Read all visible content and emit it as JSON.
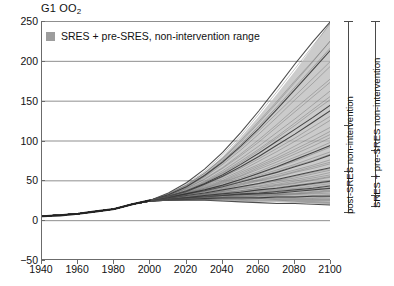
{
  "chart_data": {
    "type": "line",
    "title": "G1 OO2",
    "title_main": "G1 OO",
    "title_sub": "2",
    "xlabel": "",
    "ylabel": "",
    "xlim": [
      1940,
      2100
    ],
    "ylim": [
      -50,
      250
    ],
    "x_ticks": [
      1940,
      1960,
      1980,
      2000,
      2020,
      2040,
      2060,
      2080,
      2100
    ],
    "y_ticks": [
      -50,
      0,
      50,
      100,
      150,
      200,
      250
    ],
    "grid": "horizontal",
    "legend_position": "top-left-inside",
    "legend": [
      {
        "label": "SRES + pre-SRES, non-intervention range",
        "color": "#9d9d9d",
        "marker": "filled-square"
      }
    ],
    "band": {
      "name": "SRES + pre-SRES, non-intervention range",
      "color": "#9d9d9d",
      "x": [
        1940,
        1960,
        1980,
        1990,
        2000,
        2010,
        2020,
        2030,
        2040,
        2050,
        2060,
        2070,
        2080,
        2090,
        2100
      ],
      "upper": [
        5,
        8,
        14,
        20,
        25,
        33,
        44,
        60,
        80,
        104,
        130,
        158,
        187,
        218,
        250
      ],
      "lower": [
        5,
        8,
        14,
        20,
        24,
        27,
        29,
        30,
        30,
        29,
        27,
        25,
        23,
        21,
        19
      ]
    },
    "historical": {
      "name": "historical",
      "x": [
        1940,
        1950,
        1960,
        1970,
        1980,
        1990,
        2000
      ],
      "values": [
        5,
        6,
        8,
        11,
        14,
        20,
        25
      ]
    },
    "series": [
      {
        "name": "scenario-01",
        "values": [
          5,
          8,
          14,
          20,
          25,
          34,
          47,
          64,
          85,
          110,
          137,
          166,
          196,
          224,
          250
        ]
      },
      {
        "name": "scenario-02",
        "values": [
          5,
          8,
          14,
          20,
          25,
          33,
          44,
          59,
          78,
          100,
          124,
          149,
          175,
          200,
          226
        ]
      },
      {
        "name": "scenario-03",
        "values": [
          5,
          8,
          14,
          20,
          25,
          32,
          42,
          55,
          72,
          91,
          112,
          134,
          156,
          178,
          200
        ]
      },
      {
        "name": "scenario-04",
        "values": [
          5,
          8,
          14,
          20,
          25,
          31,
          40,
          52,
          66,
          83,
          101,
          120,
          140,
          159,
          178
        ]
      },
      {
        "name": "scenario-05",
        "values": [
          5,
          8,
          14,
          20,
          25,
          31,
          39,
          49,
          62,
          77,
          93,
          110,
          127,
          145,
          163
        ]
      },
      {
        "name": "scenario-06",
        "values": [
          5,
          8,
          14,
          20,
          25,
          30,
          37,
          46,
          57,
          70,
          84,
          99,
          114,
          129,
          145
        ]
      },
      {
        "name": "scenario-07",
        "values": [
          5,
          8,
          14,
          20,
          25,
          30,
          36,
          44,
          54,
          65,
          77,
          90,
          103,
          117,
          131
        ]
      },
      {
        "name": "scenario-08",
        "values": [
          5,
          8,
          14,
          20,
          25,
          30,
          35,
          42,
          50,
          60,
          70,
          81,
          93,
          105,
          117
        ]
      },
      {
        "name": "scenario-09",
        "values": [
          5,
          8,
          14,
          20,
          25,
          29,
          34,
          40,
          47,
          55,
          64,
          73,
          83,
          93,
          104
        ]
      },
      {
        "name": "scenario-10",
        "values": [
          5,
          8,
          14,
          20,
          25,
          29,
          33,
          38,
          44,
          51,
          58,
          66,
          74,
          83,
          92
        ]
      },
      {
        "name": "scenario-11",
        "values": [
          5,
          8,
          14,
          20,
          25,
          29,
          33,
          37,
          42,
          48,
          54,
          60,
          67,
          74,
          82
        ]
      },
      {
        "name": "scenario-12",
        "values": [
          5,
          8,
          14,
          20,
          25,
          28,
          32,
          36,
          40,
          45,
          50,
          55,
          61,
          67,
          73
        ]
      },
      {
        "name": "scenario-13",
        "values": [
          5,
          8,
          14,
          20,
          25,
          28,
          31,
          34,
          38,
          42,
          46,
          50,
          55,
          60,
          65
        ]
      },
      {
        "name": "scenario-14",
        "values": [
          5,
          8,
          14,
          20,
          24,
          27,
          30,
          33,
          36,
          39,
          42,
          45,
          49,
          53,
          57
        ]
      },
      {
        "name": "scenario-15",
        "values": [
          5,
          8,
          14,
          20,
          24,
          27,
          29,
          31,
          34,
          36,
          38,
          41,
          44,
          47,
          50
        ]
      },
      {
        "name": "scenario-16",
        "values": [
          5,
          8,
          14,
          20,
          24,
          26,
          28,
          30,
          31,
          33,
          34,
          36,
          38,
          40,
          43
        ]
      },
      {
        "name": "scenario-17",
        "values": [
          5,
          8,
          14,
          20,
          24,
          26,
          28,
          29,
          30,
          30,
          31,
          32,
          33,
          35,
          37
        ]
      },
      {
        "name": "scenario-18",
        "values": [
          5,
          8,
          14,
          20,
          24,
          26,
          27,
          28,
          28,
          28,
          28,
          29,
          29,
          30,
          31
        ]
      },
      {
        "name": "scenario-19",
        "values": [
          5,
          8,
          14,
          20,
          24,
          26,
          27,
          27,
          27,
          26,
          26,
          26,
          26,
          26,
          26
        ]
      },
      {
        "name": "scenario-20",
        "values": [
          5,
          8,
          14,
          20,
          24,
          25,
          26,
          26,
          25,
          25,
          24,
          24,
          23,
          23,
          22
        ]
      },
      {
        "name": "scenario-21",
        "values": [
          5,
          8,
          14,
          20,
          24,
          25,
          25,
          25,
          24,
          23,
          22,
          21,
          21,
          20,
          19
        ]
      },
      {
        "name": "scenario-22",
        "values": [
          5,
          8,
          14,
          20,
          25,
          31,
          41,
          54,
          70,
          88,
          108,
          129,
          151,
          172,
          194
        ]
      },
      {
        "name": "scenario-23",
        "values": [
          5,
          8,
          14,
          20,
          25,
          32,
          43,
          57,
          75,
          95,
          118,
          142,
          167,
          192,
          217
        ]
      },
      {
        "name": "scenario-24",
        "values": [
          5,
          8,
          14,
          20,
          25,
          33,
          45,
          61,
          82,
          106,
          133,
          161,
          190,
          219,
          248
        ]
      },
      {
        "name": "scenario-25",
        "values": [
          5,
          8,
          14,
          20,
          25,
          30,
          38,
          48,
          60,
          74,
          89,
          105,
          122,
          139,
          156
        ]
      },
      {
        "name": "scenario-26",
        "values": [
          5,
          8,
          14,
          20,
          25,
          30,
          36,
          45,
          55,
          67,
          80,
          94,
          108,
          123,
          138
        ]
      },
      {
        "name": "scenario-27",
        "values": [
          5,
          8,
          14,
          20,
          25,
          29,
          35,
          41,
          49,
          58,
          68,
          78,
          89,
          100,
          112
        ]
      },
      {
        "name": "scenario-28",
        "values": [
          5,
          8,
          14,
          20,
          25,
          29,
          34,
          39,
          46,
          53,
          61,
          70,
          79,
          88,
          98
        ]
      },
      {
        "name": "scenario-29",
        "values": [
          5,
          8,
          14,
          20,
          25,
          29,
          33,
          38,
          43,
          49,
          56,
          63,
          70,
          78,
          86
        ]
      },
      {
        "name": "scenario-30",
        "values": [
          5,
          8,
          14,
          20,
          24,
          28,
          32,
          36,
          41,
          46,
          51,
          57,
          63,
          69,
          76
        ]
      },
      {
        "name": "scenario-31",
        "values": [
          5,
          8,
          14,
          20,
          24,
          27,
          31,
          34,
          38,
          42,
          46,
          51,
          56,
          61,
          66
        ]
      },
      {
        "name": "scenario-32",
        "values": [
          5,
          8,
          14,
          20,
          24,
          27,
          30,
          33,
          36,
          40,
          43,
          47,
          51,
          55,
          60
        ]
      },
      {
        "name": "scenario-33",
        "values": [
          5,
          8,
          14,
          20,
          24,
          27,
          29,
          32,
          35,
          37,
          40,
          43,
          46,
          50,
          54
        ]
      },
      {
        "name": "scenario-34",
        "values": [
          5,
          8,
          14,
          20,
          24,
          26,
          29,
          31,
          33,
          35,
          37,
          39,
          42,
          45,
          48
        ]
      },
      {
        "name": "scenario-35",
        "values": [
          5,
          8,
          14,
          20,
          24,
          26,
          28,
          30,
          32,
          33,
          35,
          37,
          39,
          41,
          44
        ]
      },
      {
        "name": "scenario-36",
        "values": [
          5,
          8,
          14,
          20,
          24,
          26,
          28,
          29,
          31,
          32,
          33,
          34,
          36,
          38,
          40
        ]
      },
      {
        "name": "scenario-37",
        "values": [
          5,
          8,
          14,
          20,
          24,
          26,
          27,
          29,
          30,
          30,
          31,
          32,
          33,
          34,
          36
        ]
      },
      {
        "name": "scenario-38",
        "values": [
          5,
          8,
          14,
          20,
          24,
          26,
          27,
          28,
          29,
          29,
          29,
          30,
          30,
          31,
          32
        ]
      },
      {
        "name": "scenario-39",
        "values": [
          5,
          8,
          14,
          20,
          24,
          25,
          26,
          27,
          27,
          27,
          27,
          28,
          28,
          28,
          29
        ]
      },
      {
        "name": "scenario-40",
        "values": [
          5,
          8,
          14,
          20,
          24,
          25,
          26,
          26,
          26,
          26,
          25,
          25,
          25,
          25,
          25
        ]
      },
      {
        "name": "scenario-41",
        "values": [
          5,
          8,
          14,
          20,
          25,
          32,
          42,
          56,
          73,
          93,
          115,
          139,
          164,
          189,
          214
        ]
      },
      {
        "name": "scenario-42",
        "values": [
          5,
          8,
          14,
          20,
          25,
          31,
          40,
          51,
          65,
          81,
          98,
          117,
          136,
          155,
          174
        ]
      },
      {
        "name": "scenario-43",
        "values": [
          5,
          8,
          14,
          20,
          25,
          30,
          37,
          47,
          59,
          72,
          87,
          103,
          119,
          136,
          152
        ]
      },
      {
        "name": "scenario-44",
        "values": [
          5,
          8,
          14,
          20,
          25,
          30,
          36,
          43,
          52,
          62,
          74,
          86,
          99,
          112,
          126
        ]
      },
      {
        "name": "scenario-45",
        "values": [
          5,
          8,
          14,
          20,
          25,
          29,
          34,
          40,
          48,
          56,
          66,
          76,
          86,
          97,
          108
        ]
      },
      {
        "name": "scenario-46",
        "values": [
          5,
          8,
          14,
          20,
          24,
          28,
          33,
          38,
          44,
          51,
          59,
          67,
          76,
          85,
          94
        ]
      },
      {
        "name": "scenario-47",
        "values": [
          5,
          8,
          14,
          20,
          24,
          28,
          32,
          37,
          42,
          48,
          54,
          61,
          68,
          75,
          83
        ]
      },
      {
        "name": "scenario-48",
        "values": [
          5,
          8,
          14,
          20,
          24,
          27,
          31,
          35,
          39,
          44,
          49,
          54,
          60,
          65,
          71
        ]
      },
      {
        "name": "scenario-49",
        "values": [
          5,
          8,
          14,
          20,
          24,
          27,
          30,
          33,
          37,
          41,
          45,
          49,
          53,
          58,
          63
        ]
      },
      {
        "name": "scenario-50",
        "values": [
          5,
          8,
          14,
          20,
          24,
          26,
          29,
          32,
          34,
          37,
          40,
          44,
          47,
          51,
          55
        ]
      },
      {
        "name": "scenario-51",
        "values": [
          5,
          8,
          14,
          20,
          24,
          26,
          28,
          31,
          33,
          35,
          38,
          40,
          43,
          46,
          49
        ]
      },
      {
        "name": "scenario-52",
        "values": [
          5,
          8,
          14,
          20,
          24,
          26,
          28,
          30,
          32,
          34,
          36,
          38,
          40,
          43,
          46
        ]
      },
      {
        "name": "scenario-53",
        "values": [
          5,
          8,
          14,
          20,
          24,
          26,
          27,
          29,
          31,
          32,
          33,
          35,
          37,
          39,
          41
        ]
      },
      {
        "name": "scenario-54",
        "values": [
          5,
          8,
          14,
          20,
          24,
          25,
          27,
          28,
          29,
          31,
          32,
          33,
          34,
          36,
          38
        ]
      },
      {
        "name": "scenario-55",
        "values": [
          5,
          8,
          14,
          20,
          24,
          25,
          26,
          28,
          29,
          29,
          30,
          31,
          32,
          33,
          34
        ]
      },
      {
        "name": "scenario-56",
        "values": [
          5,
          8,
          14,
          20,
          24,
          25,
          26,
          27,
          28,
          28,
          28,
          29,
          29,
          30,
          30
        ]
      },
      {
        "name": "scenario-57",
        "values": [
          5,
          8,
          14,
          20,
          24,
          25,
          26,
          26,
          27,
          27,
          27,
          27,
          27,
          27,
          27
        ]
      },
      {
        "name": "scenario-58",
        "values": [
          5,
          8,
          14,
          20,
          24,
          25,
          25,
          26,
          26,
          25,
          25,
          25,
          24,
          24,
          24
        ]
      },
      {
        "name": "scenario-59",
        "values": [
          5,
          8,
          14,
          20,
          24,
          25,
          25,
          25,
          24,
          24,
          23,
          23,
          22,
          22,
          21
        ]
      },
      {
        "name": "scenario-60",
        "values": [
          5,
          8,
          14,
          20,
          25,
          33,
          44,
          59,
          77,
          98,
          122,
          147,
          173,
          199,
          226
        ]
      }
    ],
    "range_bars": [
      {
        "id": "post-sres",
        "label": "post-SRES non-intervention",
        "top_value": 250,
        "bottom_value": 10,
        "ticks": [
          250,
          120,
          62,
          10
        ]
      },
      {
        "id": "sres-pre-sres",
        "label": "SRES + pre-SRES non-intervention",
        "top_value": 250,
        "bottom_value": 18,
        "ticks": [
          250,
          88,
          56,
          32,
          18
        ]
      }
    ]
  }
}
